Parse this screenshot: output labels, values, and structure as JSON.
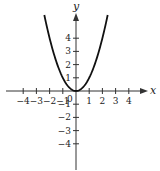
{
  "chart_data": {
    "type": "line",
    "title": "",
    "function": "y = x^2",
    "xlabel": "x",
    "ylabel": "y",
    "origin_label": "0",
    "xlim": [
      -4.8,
      5
    ],
    "ylim": [
      -6,
      6.8
    ],
    "x_ticks": [
      -4,
      -3,
      -2,
      -1,
      1,
      2,
      3,
      4
    ],
    "x_tick_labels": [
      "−4",
      "−3",
      "−2",
      "−1",
      "1",
      "2",
      "3",
      "4"
    ],
    "y_ticks": [
      -4,
      -3,
      -2,
      -1,
      1,
      2,
      3,
      4
    ],
    "y_tick_labels": [
      "−4",
      "−3",
      "−2",
      "−1",
      "1",
      "2",
      "3",
      "4"
    ],
    "grid": false,
    "legend": null,
    "series": [
      {
        "name": "y = x^2",
        "x": [
          -2.4,
          -2,
          -1.5,
          -1,
          -0.5,
          0,
          0.5,
          1,
          1.5,
          2,
          2.4
        ],
        "y": [
          5.76,
          4,
          2.25,
          1,
          0.25,
          0,
          0.25,
          1,
          2.25,
          4,
          5.76
        ]
      }
    ],
    "colors": {
      "curve": "#111111",
      "axes": "#333333"
    }
  }
}
